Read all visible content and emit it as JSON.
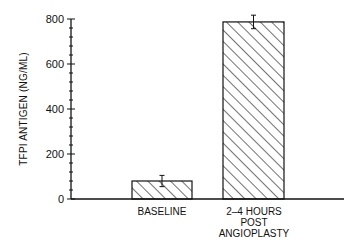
{
  "chart_data": {
    "type": "bar",
    "title": "",
    "xlabel": "",
    "ylabel": "TFPI ANTIGEN (NG/ML)",
    "ylim": [
      0,
      800
    ],
    "yticks": [
      0,
      200,
      400,
      600,
      800
    ],
    "minor_ticks_per_major": 4,
    "grid": false,
    "legend": null,
    "fill_pattern": "diagonal-hatch",
    "categories": [
      "BASELINE",
      "2-4 HOURS POST ANGIOPLASTY"
    ],
    "values": [
      80,
      787
    ],
    "error": [
      25,
      30
    ]
  },
  "labels": {
    "ylabel": "TFPI ANTIGEN (NG/ML)",
    "y0": "0",
    "y200": "200",
    "y400": "400",
    "y600": "600",
    "y800": "800",
    "cat0": "BASELINE",
    "cat1": "2–4 HOURS\nPOST\nANGIOPLASTY"
  }
}
